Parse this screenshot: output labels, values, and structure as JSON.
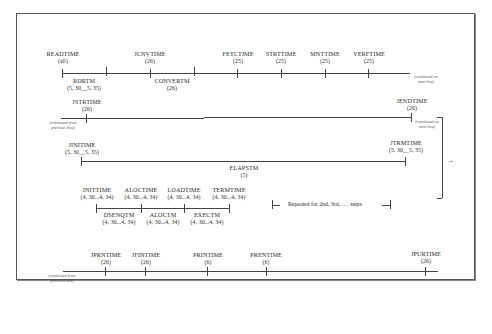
{
  "diagram": {
    "row1": {
      "tops": [
        {
          "name": "READTIME",
          "value": "(all)"
        },
        {
          "name": "JCNVTIME",
          "value": "(26)"
        },
        {
          "name": "FETCTIME",
          "value": "(25)"
        },
        {
          "name": "STRTTIME",
          "value": "(25)"
        },
        {
          "name": "MNTTIME",
          "value": "(25)"
        },
        {
          "name": "VERFTIME",
          "value": "(25)"
        }
      ],
      "bottoms": [
        {
          "name": "RDRTM",
          "value": "(5, 30__5, 35)"
        },
        {
          "name": "CONVERTM",
          "value": "(26)"
        }
      ],
      "note_right": "(continued on next line)"
    },
    "row2": {
      "tops": [
        {
          "name": "JSTRTIME",
          "value": "(26)"
        },
        {
          "name": "JENDTIME",
          "value": "(26)"
        }
      ],
      "note_left": "(continued from previous line)",
      "note_right": "(continued on next line)"
    },
    "row3": {
      "tops": [
        {
          "name": "JINITIME",
          "value": "(5, 30__5, 35)"
        },
        {
          "name": "JTRMTIME",
          "value": "(5, 30__5, 35)"
        }
      ],
      "bottoms": [
        {
          "name": "ELAPSTM",
          "value": "(5)"
        }
      ]
    },
    "row4": {
      "tops": [
        {
          "name": "INITTIME",
          "value": "(4, 30...4, 34)"
        },
        {
          "name": "ALOCTIME",
          "value": "(4, 30...4, 34)"
        },
        {
          "name": "LOADTIME",
          "value": "(4, 30...4, 34)"
        },
        {
          "name": "TERMTIME",
          "value": "(4, 30...4, 34)"
        }
      ],
      "bottoms": [
        {
          "name": "DSENQTM",
          "value": "(4, 30...4, 34)"
        },
        {
          "name": "ALOCTM",
          "value": "(4, 30...4, 34)"
        },
        {
          "name": "EXECTM",
          "value": "(4, 30...4, 34)"
        }
      ],
      "repeat_note": "Repeated for 2nd, 3rd, . . . steps"
    },
    "row5": {
      "tops": [
        {
          "name": "JPRNTIME",
          "value": "(26)"
        },
        {
          "name": "JFINTIME",
          "value": "(26)"
        },
        {
          "name": "PRINTIME",
          "value": "(6)"
        },
        {
          "name": "PRENTIME",
          "value": "(6)"
        },
        {
          "name": "JPURTIME",
          "value": "(26)"
        }
      ],
      "note_left": "(continued from previous line)"
    }
  }
}
